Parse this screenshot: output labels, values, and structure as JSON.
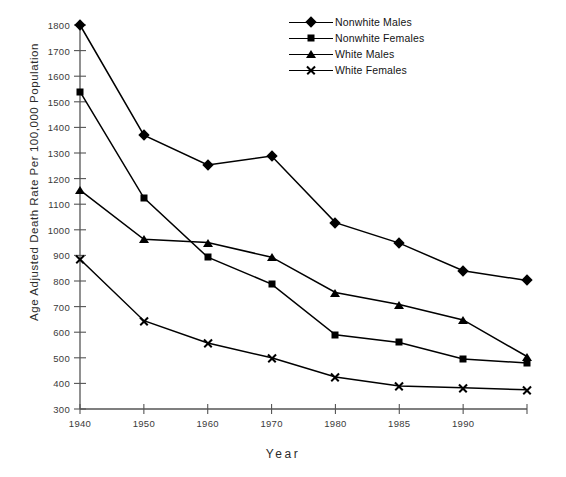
{
  "chart_data": {
    "type": "line",
    "title": "",
    "xlabel": "Year",
    "ylabel": "Age Adjusted Death Rate Per 100,000 Population",
    "categories": [
      "1940",
      "1950",
      "1960",
      "1970",
      "1980",
      "1985",
      "1990",
      ""
    ],
    "x_tick_labels": [
      "1940",
      "1950",
      "1960",
      "1970",
      "1980",
      "1985",
      "1990",
      ""
    ],
    "y_tick_labels": [
      "1800",
      "1700",
      "1600",
      "1500",
      "1400",
      "1300",
      "1200",
      "1100",
      "1000",
      "900",
      "800",
      "700",
      "600",
      "500",
      "400",
      "300"
    ],
    "ylim": [
      300,
      1800
    ],
    "y_tick_step": 100,
    "grid": false,
    "legend_position": "top-right",
    "series": [
      {
        "name": "Nonwhite Males",
        "marker": "diamond",
        "color": "#000000",
        "values": [
          1800,
          1370,
          1253,
          1288,
          1028,
          948,
          840,
          802
        ]
      },
      {
        "name": "Nonwhite Females",
        "marker": "square",
        "color": "#000000",
        "values": [
          1540,
          1125,
          893,
          788,
          590,
          560,
          495,
          480
        ]
      },
      {
        "name": "White Males",
        "marker": "triangle",
        "color": "#000000",
        "values": [
          1155,
          963,
          950,
          893,
          755,
          708,
          648,
          505
        ]
      },
      {
        "name": "White Females",
        "marker": "x",
        "color": "#000000",
        "values": [
          885,
          645,
          558,
          500,
          425,
          390,
          383,
          375
        ]
      }
    ]
  }
}
